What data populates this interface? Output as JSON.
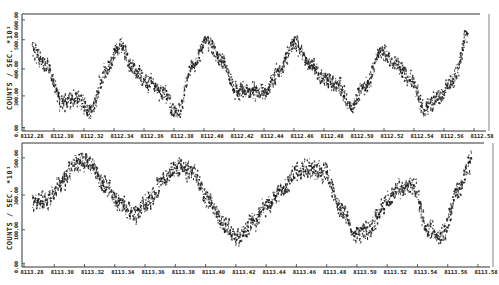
{
  "chart_data": [
    {
      "type": "scatter",
      "title": "",
      "xlabel": "",
      "ylabel": "COUNTS / SEC. *10¹",
      "x_tick_labels": [
        "8112.28",
        "8112.30",
        "8112.32",
        "8112.34",
        "8112.36",
        "8112.38",
        "8112.40",
        "8112.42",
        "8112.44",
        "8112.46",
        "8112.48",
        "8112.50",
        "8112.52",
        "8112.54",
        "8112.56",
        "8112.58"
      ],
      "y_tick_labels": [
        "0.00",
        "100.00",
        "200.00",
        "300.00",
        "400.00",
        "500.00",
        "600.00"
      ],
      "ylim": [
        0,
        600
      ],
      "xlim": [
        8112.28,
        8112.59
      ],
      "grid": false,
      "series": [
        {
          "name": "counts",
          "x": [
            8112.28,
            8112.29,
            8112.3,
            8112.31,
            8112.32,
            8112.33,
            8112.34,
            8112.35,
            8112.36,
            8112.37,
            8112.38,
            8112.39,
            8112.4,
            8112.41,
            8112.42,
            8112.43,
            8112.44,
            8112.45,
            8112.46,
            8112.47,
            8112.48,
            8112.49,
            8112.5,
            8112.51,
            8112.52,
            8112.53,
            8112.54,
            8112.55,
            8112.56,
            8112.57,
            8112.58
          ],
          "values": [
            420,
            340,
            150,
            170,
            110,
            300,
            440,
            320,
            250,
            200,
            90,
            330,
            470,
            370,
            210,
            210,
            200,
            310,
            460,
            360,
            280,
            240,
            140,
            240,
            420,
            350,
            280,
            120,
            180,
            270,
            500
          ]
        }
      ]
    },
    {
      "type": "scatter",
      "title": "",
      "xlabel": "",
      "ylabel": "COUNTS / SEC. *10¹",
      "x_tick_labels": [
        "8113.28",
        "8113.30",
        "8113.32",
        "8113.34",
        "8113.36",
        "8113.38",
        "8113.40",
        "8113.42",
        "8113.44",
        "8113.46",
        "8113.48",
        "8113.50",
        "8113.52",
        "8113.54",
        "8113.56",
        "8113.58"
      ],
      "y_tick_labels": [
        "0.00",
        "100.00",
        "200.00",
        "300.00",
        "400.00",
        "500.00"
      ],
      "ylim": [
        0,
        550
      ],
      "xlim": [
        8113.28,
        8113.59
      ],
      "grid": false,
      "series": [
        {
          "name": "counts",
          "x": [
            8113.28,
            8113.29,
            8113.3,
            8113.31,
            8113.32,
            8113.33,
            8113.34,
            8113.35,
            8113.36,
            8113.37,
            8113.38,
            8113.39,
            8113.4,
            8113.41,
            8113.42,
            8113.43,
            8113.44,
            8113.45,
            8113.46,
            8113.47,
            8113.48,
            8113.49,
            8113.5,
            8113.51,
            8113.52,
            8113.53,
            8113.54,
            8113.55,
            8113.56,
            8113.57,
            8113.58
          ],
          "values": [
            290,
            300,
            380,
            470,
            460,
            360,
            280,
            240,
            300,
            400,
            450,
            420,
            300,
            200,
            130,
            200,
            280,
            340,
            420,
            440,
            420,
            270,
            150,
            170,
            280,
            350,
            360,
            170,
            140,
            340,
            470
          ]
        }
      ]
    }
  ],
  "figure": {
    "top_panel": {
      "ylabel": "COUNTS / SEC. *10¹",
      "yticks": [
        {
          "label": "600.00",
          "pos": 0.05
        },
        {
          "label": "500.00",
          "pos": 0.22
        },
        {
          "label": "400.00",
          "pos": 0.47
        },
        {
          "label": "300.00",
          "pos": 0.7
        },
        {
          "label": "0.00",
          "pos": 0.97
        }
      ],
      "xticks": [
        "8112.28",
        "8112.30",
        "8112.32",
        "8112.34",
        "8112.36",
        "8112.38",
        "8112.40",
        "8112.42",
        "8112.44",
        "8112.46",
        "8112.48",
        "8112.50",
        "8112.52",
        "8112.54",
        "8112.56",
        "8112.58"
      ]
    },
    "bottom_panel": {
      "ylabel": "COUNTS / SEC. *10¹",
      "yticks": [
        {
          "label": "500.00",
          "pos": 0.12
        },
        {
          "label": "300.00",
          "pos": 0.42
        },
        {
          "label": "100.00",
          "pos": 0.7
        },
        {
          "label": "0.00",
          "pos": 0.97
        }
      ],
      "xticks": [
        "8113.28",
        "8113.30",
        "8113.32",
        "8113.34",
        "8113.36",
        "8113.38",
        "8113.40",
        "8113.42",
        "8113.44",
        "8113.46",
        "8113.48",
        "8113.50",
        "8113.52",
        "8113.54",
        "8113.56",
        "8113.58"
      ]
    },
    "colors": {
      "ink": "#1a1a1a",
      "paper": "#ffffff",
      "axis": "#333333"
    }
  }
}
